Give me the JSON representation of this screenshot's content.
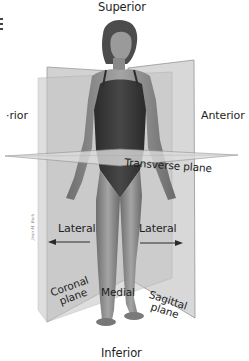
{
  "diagram": {
    "labels": {
      "superior": "Superior",
      "inferior": "Inferior",
      "anterior": "Anterior",
      "posterior_partial": "·rior",
      "lateral_left": "Lateral",
      "lateral_right": "Lateral",
      "medial": "Medial",
      "transverse_plane": "Transverse plane",
      "coronal_line1": "Coronal",
      "coronal_line2": "plane",
      "sagittal_line1": "Sagittal",
      "sagittal_line2": "plane"
    },
    "signature": "Jean M. Bark",
    "colors": {
      "background": "#ffffff",
      "plane_fill": "#c9c9c9",
      "plane_edge": "#8a8a8a",
      "transverse_fill": "#d8d8d8",
      "skin": "#8f8f8f",
      "swimsuit": "#3a3a3a",
      "hair": "#4a4a4a",
      "text": "#1e1e1e",
      "arrow": "#2a2a2a"
    },
    "arrows": [
      {
        "direction": "left",
        "label_ref": "lateral_left"
      },
      {
        "direction": "right",
        "label_ref": "lateral_right"
      }
    ]
  }
}
